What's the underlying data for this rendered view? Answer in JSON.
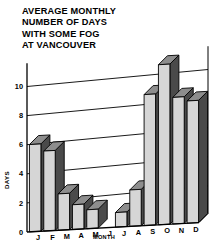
{
  "title": {
    "lines": [
      "AVERAGE MONTHLY",
      "NUMBER OF DAYS",
      "WITH SOME FOG",
      "AT VANCOUVER"
    ]
  },
  "colors": {
    "bar_face": "#d6d6d6",
    "bar_side": "#4a4a4a",
    "bar_top": "#8d8d8d",
    "outline": "#000000",
    "background": "#ffffff"
  },
  "chart_data": {
    "type": "bar",
    "title": "AVERAGE MONTHLY NUMBER OF DAYS WITH SOME FOG AT VANCOUVER",
    "xlabel": "MONTH",
    "ylabel": "DAYS",
    "categories": [
      "J",
      "F",
      "M",
      "A",
      "M",
      "J",
      "J",
      "A",
      "S",
      "O",
      "N",
      "D"
    ],
    "category_names": [
      "January",
      "February",
      "March",
      "April",
      "May",
      "June",
      "July",
      "August",
      "September",
      "October",
      "November",
      "December"
    ],
    "values": [
      6,
      5.5,
      2.5,
      1.7,
      1.3,
      0,
      1,
      2.5,
      9,
      11,
      8.7,
      8.4
    ],
    "ylim": [
      0,
      11.6
    ],
    "yticks": [
      0,
      2,
      4,
      6,
      8,
      10
    ],
    "ytick_labels": [
      "0",
      "2",
      "4",
      "6",
      "8",
      "10"
    ],
    "grid": true,
    "grid_axis": "y",
    "legend": false,
    "style": "3d-isometric-bars"
  }
}
